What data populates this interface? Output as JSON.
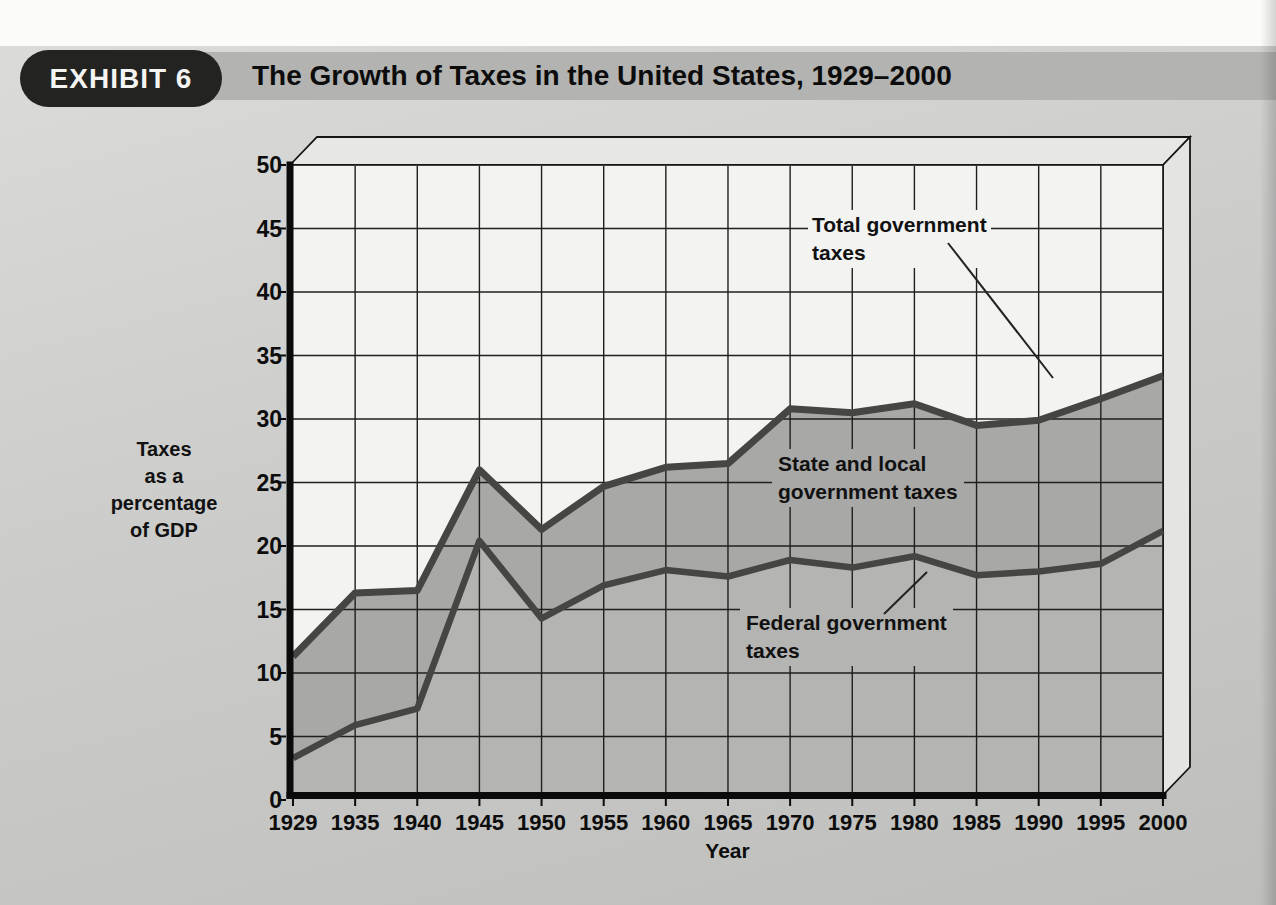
{
  "labels": {
    "exhibit_badge": "EXHIBIT 6",
    "title": "The Growth of Taxes in the United States, 1929–2000",
    "total_annotation": "Total government\ntaxes",
    "state_local_annotation": "State and local\ngovernment taxes",
    "federal_annotation": "Federal government\ntaxes",
    "y_axis_title": "Taxes\nas a\npercentage\nof GDP",
    "x_axis_title": "Year"
  },
  "chart_data": {
    "type": "area",
    "title": "The Growth of Taxes in the United States, 1929–2000",
    "exhibit": "EXHIBIT 6",
    "x": [
      "1929",
      "1935",
      "1940",
      "1945",
      "1950",
      "1955",
      "1960",
      "1965",
      "1970",
      "1975",
      "1980",
      "1985",
      "1990",
      "1995",
      "2000"
    ],
    "series": [
      {
        "name": "Total government taxes",
        "values": [
          11.3,
          16.3,
          16.5,
          26.0,
          21.3,
          24.7,
          26.2,
          26.5,
          30.8,
          30.5,
          31.2,
          29.5,
          29.9,
          31.6,
          33.4
        ]
      },
      {
        "name": "Federal government taxes",
        "values": [
          3.3,
          5.9,
          7.2,
          20.4,
          14.3,
          16.9,
          18.1,
          17.6,
          18.9,
          18.3,
          19.2,
          17.7,
          18.0,
          18.6,
          21.2
        ]
      }
    ],
    "band_between_series_label": "State and local government taxes",
    "xlabel": "Year",
    "ylabel": "Taxes as a percentage of GDP",
    "ylim": [
      0,
      50
    ],
    "yticks": [
      "0",
      "5",
      "10",
      "15",
      "20",
      "25",
      "30",
      "35",
      "40",
      "45",
      "50"
    ],
    "grid": true,
    "legend_position": "direct labels with leader lines",
    "style": "grayscale textbook figure with 3D slab border",
    "colors": {
      "plot_background": "#f3f3f1",
      "state_local_band": "#a8a8a6",
      "federal_area": "#b4b4b2",
      "data_line": "#454543",
      "gridline": "#1f1f1d",
      "axis": "#0b0b0b",
      "title_bar": "#b3b3b1",
      "badge": "#232321",
      "page_background": "#cccccb"
    }
  }
}
